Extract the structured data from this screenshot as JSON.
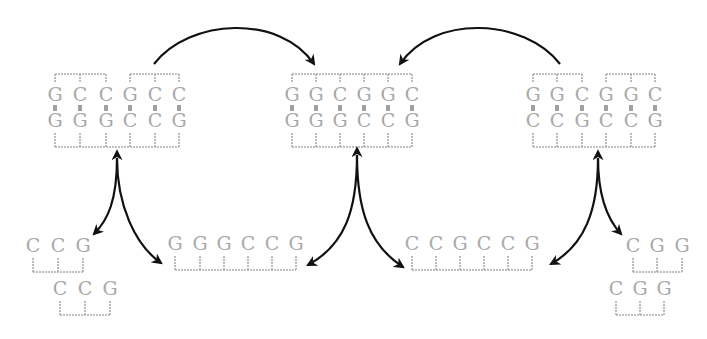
{
  "colors": {
    "base_text": "#a8a8a8",
    "bracket": "#acacac",
    "arrow": "#111111",
    "background": "#ffffff"
  },
  "duplexes": [
    {
      "id": "left-duplex",
      "x": [
        55,
        80,
        106,
        130,
        155,
        179
      ],
      "top_y": 101,
      "bottom_y": 127,
      "top_strand": [
        "G",
        "C",
        "C",
        "G",
        "C",
        "C"
      ],
      "bottom_strand": [
        "G",
        "G",
        "G",
        "C",
        "C",
        "G"
      ],
      "top_brackets": [
        [
          0,
          2
        ],
        [
          3,
          5
        ]
      ],
      "bottom_brackets": [
        [
          0,
          5
        ]
      ]
    },
    {
      "id": "center-duplex",
      "x": [
        292,
        316,
        340,
        364,
        388,
        412
      ],
      "top_y": 101,
      "bottom_y": 127,
      "top_strand": [
        "G",
        "G",
        "C",
        "G",
        "G",
        "C"
      ],
      "bottom_strand": [
        "G",
        "G",
        "G",
        "C",
        "C",
        "G"
      ],
      "top_brackets": [
        [
          0,
          5
        ]
      ],
      "bottom_brackets": [
        [
          0,
          5
        ]
      ]
    },
    {
      "id": "right-duplex",
      "x": [
        533,
        557,
        582,
        606,
        631,
        655
      ],
      "top_y": 101,
      "bottom_y": 127,
      "top_strand": [
        "G",
        "G",
        "C",
        "G",
        "G",
        "C"
      ],
      "bottom_strand": [
        "C",
        "C",
        "G",
        "C",
        "C",
        "G"
      ],
      "top_brackets": [
        [
          0,
          2
        ],
        [
          3,
          5
        ]
      ],
      "bottom_brackets": [
        [
          0,
          5
        ]
      ]
    }
  ],
  "single_strands": [
    {
      "id": "left-fragment-1",
      "x": [
        33,
        58,
        83
      ],
      "y": 252,
      "bases": [
        "C",
        "C",
        "G"
      ]
    },
    {
      "id": "left-fragment-2",
      "x": [
        60,
        85,
        110
      ],
      "y": 295,
      "bases": [
        "C",
        "C",
        "G"
      ]
    },
    {
      "id": "left-strand-6",
      "x": [
        175,
        200,
        224,
        248,
        272,
        296
      ],
      "y": 250,
      "bases": [
        "G",
        "G",
        "G",
        "C",
        "C",
        "G"
      ]
    },
    {
      "id": "right-strand-6",
      "x": [
        412,
        436,
        460,
        484,
        508,
        532
      ],
      "y": 250,
      "bases": [
        "C",
        "C",
        "G",
        "C",
        "C",
        "G"
      ]
    },
    {
      "id": "right-fragment-1",
      "x": [
        633,
        657,
        682
      ],
      "y": 252,
      "bases": [
        "C",
        "G",
        "G"
      ]
    },
    {
      "id": "right-fragment-2",
      "x": [
        616,
        640,
        664
      ],
      "y": 295,
      "bases": [
        "C",
        "G",
        "G"
      ]
    }
  ],
  "arrows": [
    {
      "id": "left-to-center-arc",
      "d": "M154,64 C190,18 280,14 314,64",
      "head_at_end": true,
      "head_at_start": false
    },
    {
      "id": "right-to-center-arc",
      "d": "M560,64 C524,18 434,14 400,64",
      "head_at_end": true,
      "head_at_start": false
    },
    {
      "id": "left-fork-a",
      "d": "M117,158 C117,200 108,220 94,234",
      "head_at_end": true,
      "head_at_start": true
    },
    {
      "id": "left-fork-b",
      "d": "M117,158 C117,205 135,245 161,263",
      "head_at_end": true,
      "head_at_start": false
    },
    {
      "id": "center-fork-a",
      "d": "M357,155 C357,210 345,245 308,265",
      "head_at_end": true,
      "head_at_start": true
    },
    {
      "id": "center-fork-b",
      "d": "M357,155 C357,210 369,245 403,267",
      "head_at_end": true,
      "head_at_start": false
    },
    {
      "id": "right-fork-a",
      "d": "M598,158 C598,210 585,245 551,264",
      "head_at_end": true,
      "head_at_start": true
    },
    {
      "id": "right-fork-b",
      "d": "M598,158 C598,195 608,220 621,234",
      "head_at_end": true,
      "head_at_start": false
    }
  ]
}
